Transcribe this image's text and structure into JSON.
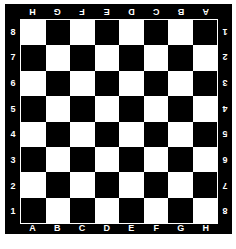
{
  "board": {
    "colors": {
      "frame": "#000000",
      "light": "#ffffff",
      "dark": "#000000",
      "label": "#ffffff"
    },
    "files": [
      "A",
      "B",
      "C",
      "D",
      "E",
      "F",
      "G",
      "H"
    ],
    "ranks": [
      "8",
      "7",
      "6",
      "5",
      "4",
      "3",
      "2",
      "1"
    ],
    "bottom_left_square": "dark",
    "top_label_orientation": "rotated-180",
    "right_label_orientation": "rotated-180"
  }
}
